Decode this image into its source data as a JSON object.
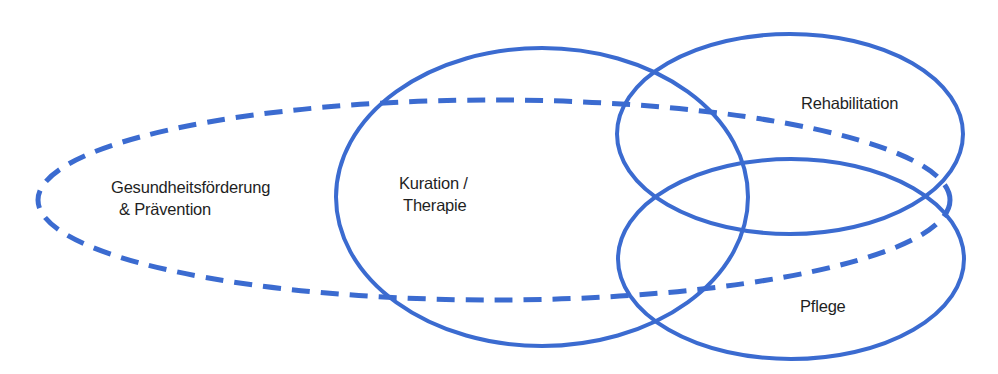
{
  "diagram": {
    "stroke_color": "#3b6bd0",
    "shapes": [
      {
        "id": "praevention",
        "style": "dashed",
        "cx": 494,
        "cy": 200,
        "rx": 456,
        "ry": 100
      },
      {
        "id": "kuration",
        "style": "solid",
        "cx": 542,
        "cy": 197,
        "rx": 206,
        "ry": 149
      },
      {
        "id": "rehabilitation",
        "style": "solid",
        "cx": 790,
        "cy": 134,
        "rx": 173,
        "ry": 100
      },
      {
        "id": "pflege",
        "style": "solid",
        "cx": 791,
        "cy": 259,
        "rx": 173,
        "ry": 100
      }
    ],
    "labels": {
      "praevention_line1": "Gesundheitsförderung",
      "praevention_line2": "& Prävention",
      "kuration_line1": "Kuration /",
      "kuration_line2": "Therapie",
      "rehabilitation": "Rehabilitation",
      "pflege": "Pflege"
    }
  }
}
